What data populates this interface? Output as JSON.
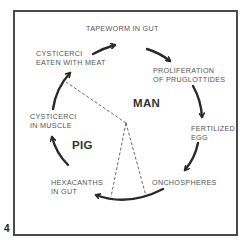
{
  "figure": {
    "number": "4",
    "hosts": {
      "definitive": "MAN",
      "intermediate": "PIG"
    },
    "stages": [
      {
        "id": "tapeworm",
        "label": "TAPEWORM IN GUT"
      },
      {
        "id": "proliferation",
        "label": "PROLIFERATION\nOF PRUGLOTTIDES"
      },
      {
        "id": "egg",
        "label": "FERTILIZED\nEGG"
      },
      {
        "id": "onchospheres",
        "label": "ONCHOSPHERES"
      },
      {
        "id": "hexacanths",
        "label": "HEXACANTHS\nIN GUT"
      },
      {
        "id": "cysticerci_muscle",
        "label": "CYSTICERCI\nIN MUSCLE"
      },
      {
        "id": "cysticerci_eaten",
        "label": "CYSTICERCI\nEATEN WITH MEAT"
      }
    ],
    "colors": {
      "frame": "#4a4a4a",
      "arrow": "#2a2a2a",
      "text": "#555555",
      "dashed": "#444444"
    }
  }
}
